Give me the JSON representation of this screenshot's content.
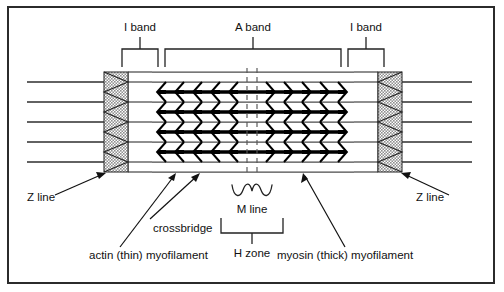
{
  "figure": {
    "type": "biological-diagram"
  },
  "top_labels": {
    "i_band_left": "I band",
    "a_band": "A band",
    "i_band_right": "I band"
  },
  "callouts": {
    "z_line_left": "Z line",
    "z_line_right": "Z line",
    "crossbridge": "crossbridge",
    "m_line": "M line",
    "h_zone": "H zone",
    "actin": "actin (thin) myofilament",
    "myosin": "myosin (thick) myofilament"
  },
  "geometry": {
    "z_left_x": 104,
    "z_right_x": 378,
    "z_width": 24,
    "a_band_start": 152,
    "a_band_end": 354,
    "m_line_center": 252,
    "actin_rows": [
      82,
      102,
      122,
      142,
      162
    ],
    "myosin_rows": [
      92,
      112,
      132,
      152
    ],
    "struct_top": 72,
    "struct_bottom": 172
  },
  "colors": {
    "frame": "#2b2b2b",
    "myosin": "#000000",
    "actin": "#4a4a4a",
    "z_band_fill": "#b9b9b9",
    "text": "#111111",
    "background": "#ffffff"
  }
}
